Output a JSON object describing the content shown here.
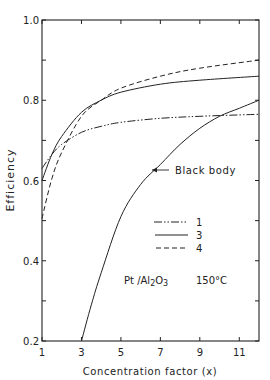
{
  "chart_data": {
    "type": "line",
    "title": "",
    "xlabel": "Concentration factor (x)",
    "ylabel": "Efficiency",
    "xlim": [
      1,
      12
    ],
    "ylim": [
      0.2,
      1.0
    ],
    "xticks": [
      1,
      3,
      5,
      7,
      9,
      11
    ],
    "xtick_labels": [
      "1",
      "3",
      "5",
      "7",
      "9",
      "11"
    ],
    "yticks": [
      0.2,
      0.3,
      0.4,
      0.5,
      0.6,
      0.7,
      0.8,
      0.9,
      1.0
    ],
    "ytick_labels": [
      "0.2",
      "",
      "0.4",
      "",
      "0.6",
      "",
      "0.8",
      "",
      "1.0"
    ],
    "grid": false,
    "legend_position": "inside-lower-right",
    "annotations": [
      {
        "text": "Black body",
        "points_to": "Black body curve",
        "at_x": 6.6,
        "at_y": 0.625
      },
      {
        "text": "Pt /Al2O3",
        "x": 7.8,
        "y": 0.3
      },
      {
        "text": "150°C",
        "x": 10.2,
        "y": 0.3
      }
    ],
    "series": [
      {
        "name": "1",
        "style": "dash-dot-dot",
        "x": [
          1,
          1.5,
          2,
          3,
          4,
          5,
          7,
          9,
          12
        ],
        "y": [
          0.63,
          0.665,
          0.69,
          0.72,
          0.735,
          0.745,
          0.755,
          0.76,
          0.765
        ]
      },
      {
        "name": "3",
        "style": "solid",
        "x": [
          1,
          1.5,
          2,
          3,
          4,
          5,
          7,
          9,
          12
        ],
        "y": [
          0.6,
          0.665,
          0.71,
          0.77,
          0.8,
          0.82,
          0.84,
          0.85,
          0.86
        ]
      },
      {
        "name": "4",
        "style": "dashed",
        "x": [
          1,
          1.5,
          2,
          3,
          4,
          5,
          7,
          9,
          12
        ],
        "y": [
          0.505,
          0.605,
          0.67,
          0.76,
          0.8,
          0.83,
          0.86,
          0.88,
          0.9
        ]
      },
      {
        "name": "Black body",
        "style": "solid",
        "x": [
          3,
          3.5,
          4,
          5,
          6,
          7,
          8,
          9,
          10,
          11,
          12
        ],
        "y": [
          0.2,
          0.29,
          0.37,
          0.51,
          0.59,
          0.64,
          0.69,
          0.73,
          0.76,
          0.78,
          0.8
        ]
      }
    ]
  },
  "labels": {
    "ylabel": "Efficiency",
    "xlabel": "Concentration factor (x)",
    "black_body": "Black body",
    "legend_1": "1",
    "legend_3": "3",
    "legend_4": "4",
    "catalyst": "Pt /Al",
    "catalyst_sub1": "2",
    "catalyst_o": "O",
    "catalyst_sub2": "3",
    "temperature": "150°C"
  }
}
